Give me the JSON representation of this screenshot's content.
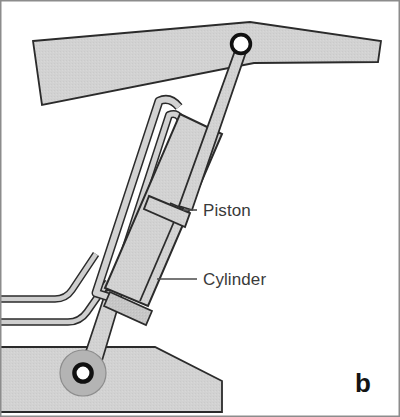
{
  "figure": {
    "panel_letter": "b",
    "width": 400,
    "height": 417,
    "background_color": "#ffffff",
    "border_color": "#8c8c8c"
  },
  "labels": {
    "piston": "Piston",
    "cylinder": "Cylinder"
  },
  "colors": {
    "metal_fill": "#d2d2d2",
    "metal_fill_light": "#dcdcdc",
    "metal_fill_dark": "#bfbfbf",
    "outline": "#2b2b2b",
    "lead_line": "#4a4a4a",
    "pivot_ring": "#111111",
    "pivot_center": "#ffffff",
    "boss_fill": "#b4b4b4",
    "text": "#3a3a3a",
    "panel_letter": "#141414"
  },
  "parts": [
    {
      "name": "upper-boom-arm",
      "label": "Upper boom arm",
      "fill": "#d2d2d2"
    },
    {
      "name": "lower-base-arm",
      "label": "Lower base arm",
      "fill": "#d2d2d2"
    },
    {
      "name": "hydraulic-cylinder",
      "label": "Cylinder",
      "fill": "#d2d2d2"
    },
    {
      "name": "piston-head",
      "label": "Piston",
      "fill": "#d2d2d2"
    },
    {
      "name": "piston-rod",
      "label": "Piston rod",
      "fill": "#d2d2d2"
    },
    {
      "name": "cylinder-base-rod",
      "label": "Cylinder base rod",
      "fill": "#d2d2d2"
    },
    {
      "name": "upper-pivot-pin",
      "label": "Upper pivot pin",
      "fill": "#ffffff"
    },
    {
      "name": "lower-pivot-pin",
      "label": "Lower pivot pin",
      "fill": "#ffffff"
    },
    {
      "name": "hydraulic-hose-upper",
      "label": "Upper hydraulic hose",
      "fill": "#d2d2d2"
    },
    {
      "name": "hydraulic-hose-lower",
      "label": "Lower hydraulic hose",
      "fill": "#d2d2d2"
    }
  ],
  "annotations": [
    {
      "name": "piston-callout",
      "text": "Piston",
      "text_x": 203,
      "text_y": 216,
      "line_from_x": 183,
      "line_from_y": 210,
      "line_to_x": 197,
      "line_to_y": 210
    },
    {
      "name": "cylinder-callout",
      "text": "Cylinder",
      "text_x": 203,
      "text_y": 285,
      "line_from_x": 157,
      "line_from_y": 279,
      "line_to_x": 197,
      "line_to_y": 279
    }
  ]
}
